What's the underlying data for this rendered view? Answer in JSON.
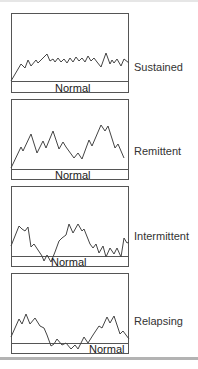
{
  "figure": {
    "panels": [
      {
        "id": "sustained",
        "label": "Sustained",
        "baseline_label": "Normal",
        "top": 13,
        "baseline_y": 68,
        "height": 80,
        "normal_label_x": 44,
        "normal_label_y": 70,
        "label_y": 48,
        "points": "0,68 10,51 14,55 17,47 20,53 25,47 27,50 33,44 36,41 39,48 42,46 44,49 47,45 50,49 53,46 56,50 59,45 62,49 65,44 68,48 71,45 74,49 77,43 80,48 83,45 86,49 90,54 95,40 99,51 101,47 103,50 106,46 110,53 113,46 118,50"
      },
      {
        "id": "remittent",
        "label": "Remittent",
        "baseline_label": "Normal",
        "top": 99,
        "baseline_y": 70,
        "height": 81,
        "normal_label_x": 44,
        "normal_label_y": 71,
        "label_y": 46,
        "points": "0,69 10,48 12,52 20,35 26,54 32,42 35,49 42,32 48,50 52,43 55,48 63,59 67,54 71,60 78,41 81,47 90,26 94,32 97,27 104,49 107,45 110,52 113,59"
      },
      {
        "id": "intermittent",
        "label": "Intermittent",
        "baseline_label": "Normal",
        "top": 186,
        "baseline_y": 70,
        "height": 81,
        "normal_label_x": 40,
        "normal_label_y": 71,
        "label_y": 44,
        "points": "0,60 8,40 11,43 14,45 17,41 20,61 23,58 27,64 31,70 33,75 36,69 40,76 44,66 48,55 51,52 55,49 58,38 62,47 67,38 71,45 73,43 79,58 82,62 85,58 88,67 92,60 95,71 99,62 103,68 106,62 110,71 113,52 116,57 118,56"
      },
      {
        "id": "relapsing",
        "label": "Relapsing",
        "baseline_label": "Normal",
        "top": 273,
        "baseline_y": 70,
        "height": 81,
        "normal_label_x": 78,
        "normal_label_y": 71,
        "label_y": 42,
        "points": "0,64 8,46 11,51 15,41 19,51 24,45 29,53 33,55 36,62 40,73 43,71 46,66 51,72 55,70 60,76 64,72 67,76 73,64 77,70 82,62 88,53 91,55 96,44 99,50 103,43 109,61 112,58 118,66"
      }
    ]
  },
  "chart_data": {
    "type": "line",
    "panels": [
      {
        "name": "Sustained",
        "reference_label": "Normal",
        "description": "Rapid rise to a persistently elevated plateau with small fluctuations; never returns to normal"
      },
      {
        "name": "Remittent",
        "reference_label": "Normal",
        "description": "Elevated temperature with wide fluctuations, remaining above normal"
      },
      {
        "name": "Intermittent",
        "reference_label": "Normal",
        "description": "Elevated spikes that return to or below normal between peaks"
      },
      {
        "name": "Relapsing",
        "reference_label": "Normal",
        "description": "Febrile episodes separated by periods of normal temperature"
      }
    ],
    "xlabel": "",
    "ylabel": "",
    "grid": false,
    "legend": "none"
  }
}
